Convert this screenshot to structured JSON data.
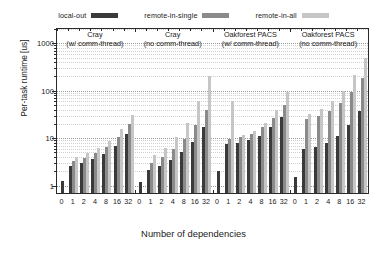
{
  "chart_data": {
    "type": "bar",
    "title": "",
    "xlabel": "Number of dependencies",
    "ylabel": "Per-task runtime [us]",
    "yscale": "log",
    "ylim": [
      0.7,
      2000
    ],
    "yticks": [
      1,
      10,
      100,
      1000
    ],
    "ytick_labels": [
      "1",
      "10",
      "100",
      "1000"
    ],
    "grid": true,
    "legend_position": "top",
    "categories": [
      "0",
      "1",
      "2",
      "4",
      "8",
      "16",
      "32"
    ],
    "groups": [
      {
        "name": "cray-with-comm-thread",
        "title_line1": "Cray",
        "title_line2": "(w/ comm-thread)",
        "series": [
          {
            "name": "local-out",
            "values": [
              1.25,
              2.6,
              3.0,
              3.6,
              4.6,
              7.0,
              12.0
            ]
          },
          {
            "name": "remote-in-single",
            "values": [
              null,
              3.3,
              3.9,
              4.8,
              6.4,
              10.5,
              20.0
            ]
          },
          {
            "name": "remote-in-all",
            "values": [
              null,
              4.0,
              4.8,
              6.2,
              8.8,
              15.5,
              31.0
            ]
          }
        ]
      },
      {
        "name": "cray-no-comm-thread",
        "title_line1": "Cray",
        "title_line2": "(no comm-thread)",
        "series": [
          {
            "name": "local-out",
            "values": [
              1.2,
              2.1,
              2.6,
              3.4,
              5.0,
              8.5,
              17.0
            ]
          },
          {
            "name": "remote-in-single",
            "values": [
              null,
              3.0,
              4.0,
              5.8,
              9.5,
              19.0,
              40.0
            ]
          },
          {
            "name": "remote-in-all",
            "values": [
              null,
              4.4,
              6.2,
              10.5,
              21.0,
              60.0,
              200.0
            ]
          }
        ]
      },
      {
        "name": "oakforest-pacs-with-comm-thread",
        "title_line1": "Oakforest PACS",
        "title_line2": "(w/ comm-thread)",
        "series": [
          {
            "name": "local-out",
            "values": [
              2.0,
              7.5,
              8.0,
              9.0,
              11.0,
              17.0,
              28.0
            ]
          },
          {
            "name": "remote-in-single",
            "values": [
              null,
              9.5,
              10.5,
              12.5,
              17.0,
              27.0,
              50.0
            ]
          },
          {
            "name": "remote-in-all",
            "values": [
              null,
              60.0,
              11.5,
              14.5,
              21.0,
              40.0,
              95.0
            ]
          }
        ]
      },
      {
        "name": "oakforest-pacs-no-comm-thread",
        "title_line1": "Oakforest PACS",
        "title_line2": "(no comm-thread)",
        "series": [
          {
            "name": "local-out",
            "values": [
              1.5,
              6.0,
              6.5,
              8.0,
              11.0,
              19.0,
              37.0
            ]
          },
          {
            "name": "remote-in-single",
            "values": [
              null,
              26.0,
              30.0,
              38.0,
              55.0,
              95.0,
              190.0
            ]
          },
          {
            "name": "remote-in-all",
            "values": [
              null,
              33.0,
              42.0,
              60.0,
              100.0,
              210.0,
              500.0
            ]
          }
        ]
      }
    ],
    "series_colors": {
      "local-out": "#3a3a3a",
      "remote-in-single": "#8a8a8a",
      "remote-in-all": "#c6c6c6"
    }
  },
  "legend": {
    "items": [
      {
        "label": "local-out",
        "color": "#3a3a3a"
      },
      {
        "label": "remote-in-single",
        "color": "#8a8a8a"
      },
      {
        "label": "remote-in-all",
        "color": "#c6c6c6"
      }
    ]
  }
}
